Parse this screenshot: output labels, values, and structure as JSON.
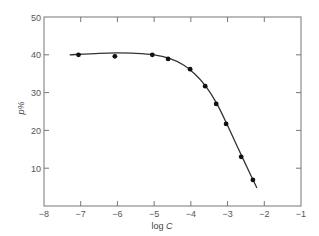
{
  "chart_data": {
    "type": "scatter",
    "title": "",
    "xlabel": "log C",
    "ylabel": "p%",
    "xlim": [
      -8,
      -1
    ],
    "ylim": [
      0,
      50
    ],
    "xticks": [
      -8,
      -7,
      -6,
      -5,
      -4,
      -3,
      -2,
      -1
    ],
    "xtick_labels": [
      "-8",
      "-7",
      "-6",
      "-5",
      "-4",
      "-3",
      "-2",
      "-1"
    ],
    "yticks": [
      10,
      20,
      30,
      40,
      50
    ],
    "ytick_labels": [
      "10",
      "20",
      "30",
      "40",
      "50"
    ],
    "grid": false,
    "legend": null,
    "series": [
      {
        "name": "data",
        "marker": "filled-circle",
        "x": [
          -7.06,
          -6.07,
          -5.05,
          -4.62,
          -4.02,
          -3.61,
          -3.31,
          -3.04,
          -2.63,
          -2.31
        ],
        "y": [
          40.0,
          39.6,
          40.0,
          38.9,
          36.2,
          31.7,
          27.0,
          21.7,
          13.0,
          6.9
        ]
      },
      {
        "name": "fitted curve",
        "line": "smooth",
        "x": [
          -7.3,
          -6.5,
          -6.0,
          -5.5,
          -5.0,
          -4.6,
          -4.2,
          -3.9,
          -3.6,
          -3.3,
          -3.0,
          -2.7,
          -2.4,
          -2.2
        ],
        "y": [
          40.0,
          40.4,
          40.5,
          40.4,
          40.0,
          39.1,
          37.3,
          35.0,
          31.8,
          27.2,
          21.3,
          15.0,
          8.8,
          4.8
        ]
      }
    ]
  },
  "axes": {
    "x_label_main": "log ",
    "x_label_var": "C",
    "y_label": "p%"
  }
}
